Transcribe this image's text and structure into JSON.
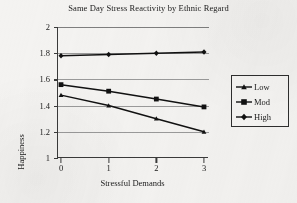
{
  "chart_data": {
    "type": "line",
    "title": "Same Day Stress Reactivity by Ethnic Regard",
    "xlabel": "Stressful Demands",
    "ylabel": "Happiness",
    "categories": [
      "0",
      "1",
      "2",
      "3"
    ],
    "x": [
      0,
      1,
      2,
      3
    ],
    "ylim": [
      1,
      2
    ],
    "ytick_labels": [
      "1",
      "1.2",
      "1.4",
      "1.6",
      "1.8",
      "2"
    ],
    "yticks": [
      1,
      1.2,
      1.4,
      1.6,
      1.8,
      2
    ],
    "grid": "horizontal",
    "legend_position": "right",
    "series": [
      {
        "name": "Low",
        "marker": "triangle",
        "values": [
          1.48,
          1.4,
          1.3,
          1.2
        ]
      },
      {
        "name": "Mod",
        "marker": "square",
        "values": [
          1.56,
          1.51,
          1.45,
          1.39
        ]
      },
      {
        "name": "High",
        "marker": "diamond",
        "values": [
          1.78,
          1.79,
          1.8,
          1.81
        ]
      }
    ],
    "line_color": "#111111"
  },
  "legend": {
    "items": [
      {
        "label": "Low"
      },
      {
        "label": "Mod"
      },
      {
        "label": "High"
      }
    ]
  }
}
